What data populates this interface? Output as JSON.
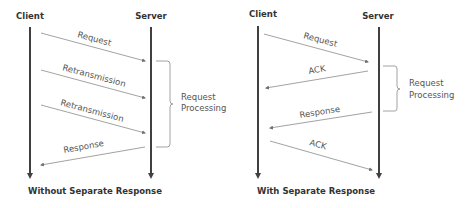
{
  "diagrams": [
    {
      "client_label": "Client",
      "server_label": "Server",
      "caption": "Without Separate Response",
      "processing_label": [
        "Request",
        "Processing"
      ],
      "messages": [
        {
          "label": "Request",
          "direction": "client-to-server"
        },
        {
          "label": "Retransmission",
          "direction": "client-to-server"
        },
        {
          "label": "Retransmission",
          "direction": "client-to-server"
        },
        {
          "label": "Response",
          "direction": "server-to-client"
        }
      ]
    },
    {
      "client_label": "Client",
      "server_label": "Server",
      "caption": "With Separate Response",
      "processing_label": [
        "Request",
        "Processing"
      ],
      "messages": [
        {
          "label": "Request",
          "direction": "client-to-server"
        },
        {
          "label": "ACK",
          "direction": "server-to-client"
        },
        {
          "label": "Response",
          "direction": "server-to-client"
        },
        {
          "label": "ACK",
          "direction": "client-to-server"
        }
      ]
    }
  ],
  "colors": {
    "timeline": "#404040",
    "message_line": "#8a8a8a",
    "text": "#555555"
  }
}
